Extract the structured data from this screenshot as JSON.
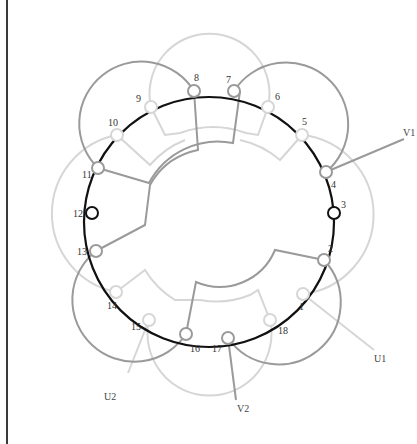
{
  "diagram": {
    "type": "stator-winding",
    "slots": 18,
    "colors": {
      "stator_ring": "#111111",
      "phase_u": "#d6d6d6",
      "phase_v": "#9a9a9a",
      "phase_w": "#1a1a1a",
      "frame": "#3a3a3a"
    },
    "slot_labels": [
      "1",
      "2",
      "3",
      "4",
      "5",
      "6",
      "7",
      "8",
      "9",
      "10",
      "11",
      "12",
      "13",
      "14",
      "15",
      "16",
      "17",
      "18"
    ],
    "terminals": {
      "v1": "V1",
      "u1": "U1",
      "u2": "U2",
      "v2": "V2"
    }
  }
}
